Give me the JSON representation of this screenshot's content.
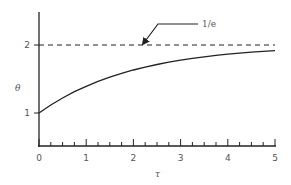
{
  "chart_data": {
    "type": "line",
    "title": "",
    "xlabel": "τ",
    "ylabel": "θ",
    "xlim": [
      0,
      5
    ],
    "ylim": [
      0.5,
      2.5
    ],
    "x_ticks": [
      0,
      1,
      2,
      3,
      4,
      5
    ],
    "x_minor_step": 0.25,
    "y_ticks": [
      1,
      2
    ],
    "grid": false,
    "legend": null,
    "series": [
      {
        "name": "θ(τ)",
        "style": "solid",
        "x": [
          0,
          0.25,
          0.5,
          0.75,
          1,
          1.25,
          1.5,
          1.75,
          2,
          2.25,
          2.5,
          2.75,
          3,
          3.25,
          3.5,
          3.75,
          4,
          4.25,
          4.5,
          4.75,
          5
        ],
        "y": [
          1.0,
          1.118,
          1.221,
          1.313,
          1.393,
          1.465,
          1.528,
          1.583,
          1.632,
          1.675,
          1.713,
          1.747,
          1.777,
          1.803,
          1.826,
          1.847,
          1.865,
          1.881,
          1.895,
          1.907,
          1.918
        ]
      },
      {
        "name": "asymptote",
        "style": "dashed",
        "x": [
          0,
          5
        ],
        "y": [
          2,
          2
        ]
      }
    ],
    "annotations": [
      {
        "text": "1/e",
        "arrow_to": {
          "x": 2.2,
          "y": 2
        }
      }
    ]
  },
  "labels": {
    "x_axis": "τ",
    "y_axis": "θ",
    "annotation": "1/e",
    "x_ticks": [
      "0",
      "1",
      "2",
      "3",
      "4",
      "5"
    ],
    "y_ticks": [
      "1",
      "2"
    ]
  }
}
